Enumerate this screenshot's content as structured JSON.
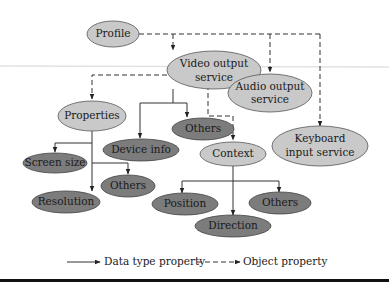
{
  "diagram": {
    "nodes": {
      "profile": {
        "label": "Profile"
      },
      "video_output": {
        "line1": "Video output",
        "line2": "service"
      },
      "audio_output": {
        "line1": "Audio output",
        "line2": "service"
      },
      "keyboard_input": {
        "line1": "Keyboard",
        "line2": "input service"
      },
      "properties": {
        "label": "Properties"
      },
      "others_video": {
        "label": "Others"
      },
      "device_info": {
        "label": "Device info"
      },
      "context": {
        "label": "Context"
      },
      "screen_size": {
        "label": "Screen size"
      },
      "others_properties": {
        "label": "Others"
      },
      "resolution": {
        "label": "Resolution"
      },
      "position": {
        "label": "Position"
      },
      "others_context": {
        "label": "Others"
      },
      "direction": {
        "label": "Direction"
      }
    },
    "edges": [
      {
        "from": "Profile",
        "to": "Video output service",
        "type": "object"
      },
      {
        "from": "Profile",
        "to": "Audio output service",
        "type": "object"
      },
      {
        "from": "Profile",
        "to": "Keyboard input service",
        "type": "object"
      },
      {
        "from": "Video output service",
        "to": "Properties",
        "type": "object"
      },
      {
        "from": "Video output service",
        "to": "Context",
        "type": "object"
      },
      {
        "from": "Video output service",
        "to": "Device info",
        "type": "data"
      },
      {
        "from": "Video output service",
        "to": "Others",
        "type": "data"
      },
      {
        "from": "Properties",
        "to": "Screen size",
        "type": "data"
      },
      {
        "from": "Properties",
        "to": "Others",
        "type": "data"
      },
      {
        "from": "Properties",
        "to": "Resolution",
        "type": "data"
      },
      {
        "from": "Context",
        "to": "Position",
        "type": "data"
      },
      {
        "from": "Context",
        "to": "Direction",
        "type": "data"
      },
      {
        "from": "Context",
        "to": "Others",
        "type": "data"
      }
    ],
    "legend": {
      "data_type": "Data type property",
      "object": "Object property"
    },
    "colors": {
      "light_node": "#c9c9c9",
      "dark_node": "#7c7c7c",
      "line": "#333333"
    }
  }
}
